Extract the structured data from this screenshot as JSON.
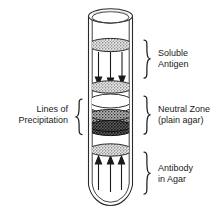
{
  "figure": {
    "colors": {
      "outline": "#1a1a1a",
      "text": "#1a1a1a",
      "background": "#ffffff",
      "disc_light": "#d8d8d8",
      "disc_dark": "#4a4a4a",
      "disc_clear": "#ffffff",
      "arrow": "#1a1a1a"
    }
  },
  "labels": {
    "soluble_antigen": "Soluble\nAntigen",
    "neutral_zone": "Neutral Zone\n(plain agar)",
    "antibody_in_agar": "Antibody\nin Agar",
    "lines_of_precipitation": "Lines of\nPrecipitation"
  },
  "regions": [
    {
      "id": "soluble-antigen",
      "label": "Soluble Antigen",
      "brace_side": "right",
      "y_top": 44,
      "y_bottom": 92,
      "arrow_direction": "down",
      "arrow_count": 3
    },
    {
      "id": "neutral-zone",
      "label": "Neutral Zone (plain agar)",
      "brace_side": "right",
      "y_top": 96,
      "y_bottom": 148,
      "arrow_direction": "none",
      "arrow_count": 0
    },
    {
      "id": "antibody-in-agar",
      "label": "Antibody in Agar",
      "brace_side": "right",
      "y_top": 152,
      "y_bottom": 206,
      "arrow_direction": "up",
      "arrow_count": 3
    },
    {
      "id": "lines-of-precipitation",
      "label": "Lines of Precipitation",
      "brace_side": "left",
      "y_top": 100,
      "y_bottom": 140,
      "arrow_direction": "none",
      "arrow_count": 0
    }
  ],
  "discs": [
    {
      "id": "disc-antigen-top",
      "cy": 45,
      "rx": 22,
      "ry": 6.5,
      "fill": "stipple-light",
      "name": "stippled-band"
    },
    {
      "id": "disc-antigen-bottom",
      "cy": 87,
      "rx": 22,
      "ry": 6.0,
      "fill": "stipple-light",
      "name": "stippled-band"
    },
    {
      "id": "disc-clear",
      "cy": 105,
      "rx": 21,
      "ry": 7.0,
      "fill": "clear",
      "name": "clear-band"
    },
    {
      "id": "disc-precip-upper",
      "cy": 117,
      "rx": 21,
      "ry": 5.5,
      "fill": "stipple-mid",
      "name": "precipitation-line"
    },
    {
      "id": "disc-precip-lower",
      "cy": 128,
      "rx": 21,
      "ry": 5.5,
      "fill": "stipple-dark",
      "name": "precipitation-line"
    },
    {
      "id": "disc-antibody-top",
      "cy": 150,
      "rx": 21,
      "ry": 6.0,
      "fill": "stipple-light",
      "name": "stippled-band"
    }
  ],
  "tube": {
    "left": 88,
    "right": 133,
    "top": 9,
    "bottom": 212,
    "rim_ry": 7,
    "wall_thickness": 4,
    "shape": "round-bottom-test-tube"
  }
}
